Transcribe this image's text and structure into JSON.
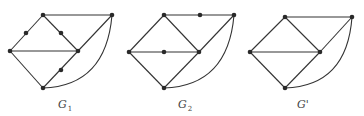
{
  "graphs": [
    {
      "name": "G1",
      "label_main": "G",
      "label_sub": "1",
      "label_pos": [
        58,
        108
      ],
      "vertices": [
        [
          10,
          51
        ],
        [
          43,
          15
        ],
        [
          112,
          15
        ],
        [
          78,
          51
        ],
        [
          43,
          88
        ]
      ],
      "subdivision_points": [
        [
          26,
          33
        ],
        [
          61,
          33
        ],
        [
          61,
          70
        ]
      ],
      "edges": [
        [
          [
            10,
            51
          ],
          [
            43,
            15
          ]
        ],
        [
          [
            43,
            15
          ],
          [
            112,
            15
          ]
        ],
        [
          [
            43,
            15
          ],
          [
            78,
            51
          ]
        ],
        [
          [
            10,
            51
          ],
          [
            78,
            51
          ]
        ],
        [
          [
            10,
            51
          ],
          [
            43,
            88
          ]
        ],
        [
          [
            43,
            88
          ],
          [
            78,
            51
          ]
        ],
        [
          [
            78,
            51
          ],
          [
            112,
            15
          ]
        ]
      ],
      "arc": "M43,88 Q106,86 112,15"
    },
    {
      "name": "G2",
      "label_main": "G",
      "label_sub": "2",
      "label_pos": [
        178,
        108
      ],
      "vertices": [
        [
          129,
          52
        ],
        [
          164,
          15
        ],
        [
          234,
          15
        ],
        [
          199,
          52
        ],
        [
          164,
          88
        ]
      ],
      "subdivision_points": [
        [
          200,
          15
        ],
        [
          164,
          52
        ]
      ],
      "edges": [
        [
          [
            129,
            52
          ],
          [
            164,
            15
          ]
        ],
        [
          [
            164,
            15
          ],
          [
            234,
            15
          ]
        ],
        [
          [
            164,
            15
          ],
          [
            199,
            52
          ]
        ],
        [
          [
            129,
            52
          ],
          [
            199,
            52
          ]
        ],
        [
          [
            129,
            52
          ],
          [
            164,
            88
          ]
        ],
        [
          [
            164,
            88
          ],
          [
            199,
            52
          ]
        ],
        [
          [
            199,
            52
          ],
          [
            234,
            15
          ]
        ]
      ],
      "arc": "M164,88 Q228,86 234,15"
    },
    {
      "name": "G'",
      "label_main": "G'",
      "label_sub": "",
      "label_pos": [
        297,
        108
      ],
      "vertices": [
        [
          250,
          52
        ],
        [
          285,
          17
        ],
        [
          352,
          17
        ],
        [
          320,
          52
        ],
        [
          285,
          88
        ]
      ],
      "subdivision_points": [],
      "edges": [
        [
          [
            250,
            52
          ],
          [
            285,
            17
          ]
        ],
        [
          [
            285,
            17
          ],
          [
            352,
            17
          ]
        ],
        [
          [
            285,
            17
          ],
          [
            320,
            52
          ]
        ],
        [
          [
            250,
            52
          ],
          [
            320,
            52
          ]
        ],
        [
          [
            250,
            52
          ],
          [
            285,
            88
          ]
        ],
        [
          [
            285,
            88
          ],
          [
            320,
            52
          ]
        ],
        [
          [
            320,
            52
          ],
          [
            352,
            17
          ]
        ]
      ],
      "arc": "M285,88 Q347,86 352,17"
    }
  ]
}
